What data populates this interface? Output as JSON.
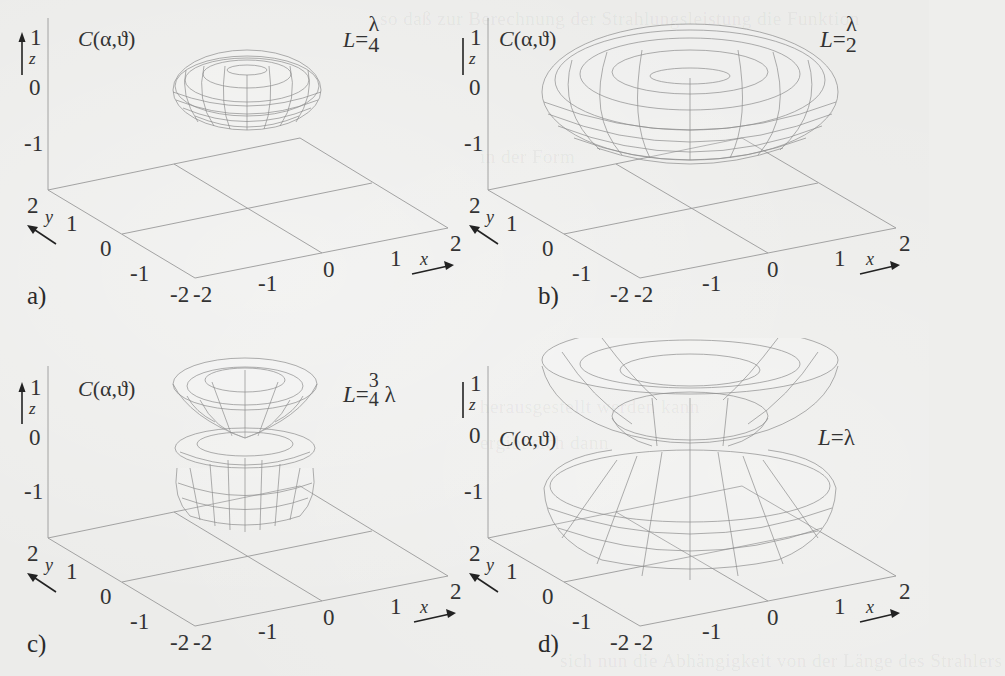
{
  "figure": {
    "common": {
      "function_label": "C(α,ϑ)",
      "z_axis": {
        "label": "z",
        "ticks": [
          "1",
          "0",
          "-1"
        ]
      },
      "y_axis": {
        "label": "y",
        "ticks": [
          "2",
          "1",
          "0",
          "-1",
          "-2"
        ]
      },
      "x_axis": {
        "label": "x",
        "ticks": [
          "-2",
          "-1",
          "0",
          "1",
          "2"
        ]
      }
    },
    "panels": [
      {
        "tag": "a)",
        "length_label": "L=",
        "length_num": "λ",
        "length_den": "4",
        "length_suffix": "",
        "x_label": "x",
        "shape": "single flat torus above plane (small)"
      },
      {
        "tag": "b)",
        "length_label": "L=",
        "length_num": "λ",
        "length_den": "2",
        "length_suffix": "",
        "x_label": "x",
        "shape": "single flat torus (larger)"
      },
      {
        "tag": "c)",
        "length_label": "L=",
        "length_num": "3",
        "length_den": "4",
        "length_suffix": " λ",
        "x_label": "x",
        "shape": "three stacked lobes (upper cone, middle disk, lower bowl)"
      },
      {
        "tag": "d)",
        "length_label": "L=",
        "length_num": "",
        "length_den": "",
        "length_suffix": "λ",
        "x_label": "x",
        "shape": "two large cone-shaped lobes meeting at z=0"
      }
    ]
  },
  "bleed_through": {
    "lines": [
      "so daß zur Berechnung der Strahlungsleistung die Funktion",
      "in der Form",
      "herausgestellt werden kann",
      "ergibt sich dann",
      "sich nun die Abhängigkeit von der Länge des Strahlers"
    ]
  }
}
